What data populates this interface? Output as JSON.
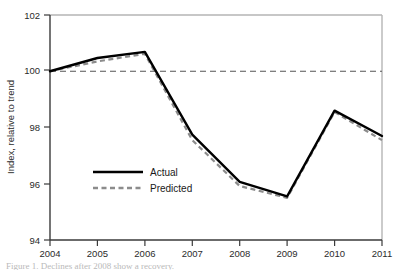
{
  "chart_data": {
    "type": "line",
    "title": "",
    "xlabel": "",
    "ylabel": "Index, relative to trend",
    "x": [
      2004,
      2005,
      2006,
      2007,
      2008,
      2009,
      2010,
      2011
    ],
    "xticklabels": [
      "2004",
      "2005",
      "2006",
      "2007",
      "2008",
      "2009",
      "2010",
      "2011"
    ],
    "yticklabels": [
      "94",
      "96",
      "98",
      "100",
      "102"
    ],
    "yticks": [
      94,
      96,
      98,
      100,
      102
    ],
    "ylim": [
      94,
      102
    ],
    "xlim": [
      2004,
      2011
    ],
    "grid": false,
    "legend_position": "center-left",
    "reference_line": {
      "label": "trend (100)",
      "value": 100,
      "style": "dashed",
      "color": "#555555"
    },
    "series": [
      {
        "name": "Actual",
        "style": "solid",
        "color": "#000000",
        "values": [
          100.0,
          100.47,
          100.69,
          97.75,
          96.07,
          95.55,
          98.6,
          97.7
        ]
      },
      {
        "name": "Predicted",
        "style": "dashed",
        "color": "#8c8c8c",
        "values": [
          100.0,
          100.35,
          100.62,
          97.55,
          95.92,
          95.5,
          98.55,
          97.55
        ]
      }
    ],
    "legend": [
      {
        "label": "Actual",
        "style": "solid",
        "color": "#000000"
      },
      {
        "label": "Predicted",
        "style": "dashed",
        "color": "#8c8c8c"
      }
    ]
  },
  "figure": {
    "caption": "Figure 1.  Declines after 2008 show a recovery."
  },
  "colors": {
    "frame": "#b5b5b5",
    "axis": "#3a3a3a",
    "actual": "#000000",
    "predicted": "#8c8c8c",
    "reference": "#555555",
    "background": "#ffffff"
  }
}
